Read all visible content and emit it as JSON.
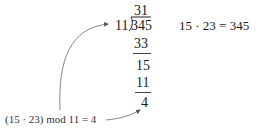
{
  "division": {
    "quotient": "31",
    "divisor": "11",
    "dividend": "345",
    "step1_subtract": "33",
    "step2_remainder": "15",
    "step2_subtract": "11",
    "remainder": "4"
  },
  "product_equation": "15 · 23 = 345",
  "annotation": "(15 · 23) mod 11 = 4"
}
